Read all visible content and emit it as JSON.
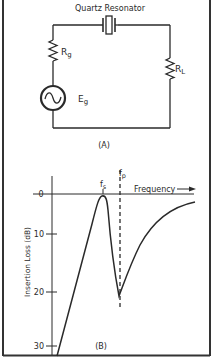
{
  "circuit": {
    "resonator_label": "Quartz Resonator",
    "source_resistor_label": "R",
    "source_resistor_sub": "g",
    "load_resistor_label": "R",
    "load_resistor_sub": "L",
    "source_label": "E",
    "source_sub": "g",
    "caption": "(A)"
  },
  "graph": {
    "caption": "(B)",
    "ylabel": "Insertion Loss (dB)",
    "xlabel": "Frequency",
    "y_ticks": [
      "0",
      "10",
      "20",
      "30"
    ],
    "series_resonance_label": "f",
    "series_resonance_sub": "s",
    "parallel_resonance_label": "f",
    "parallel_resonance_sub": "p"
  },
  "colors": {
    "line": "#2a2a2a",
    "frame": "#333333",
    "background": "#ffffff"
  }
}
